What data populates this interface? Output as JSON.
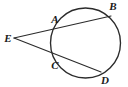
{
  "figure": {
    "type": "geometry-diagram",
    "background_color": "#ffffff",
    "stroke_color": "#2b2b2b",
    "label_color": "#1a1a1a",
    "circle": {
      "center_x": 85.5,
      "center_y": 43,
      "radius": 35
    },
    "points": [
      {
        "id": "E",
        "label": "E",
        "x": 14,
        "y": 38,
        "label_x": 8,
        "label_y": 42,
        "on_circle": false
      },
      {
        "id": "A",
        "label": "A",
        "x": 58,
        "y": 27,
        "label_x": 55,
        "label_y": 23,
        "on_circle": true
      },
      {
        "id": "B",
        "label": "B",
        "x": 111,
        "y": 16,
        "label_x": 113,
        "label_y": 10,
        "on_circle": true
      },
      {
        "id": "C",
        "label": "C",
        "x": 57,
        "y": 56,
        "label_x": 55,
        "label_y": 69,
        "on_circle": true
      },
      {
        "id": "D",
        "label": "D",
        "x": 101,
        "y": 72,
        "label_x": 105,
        "label_y": 84,
        "on_circle": true
      }
    ],
    "segments": [
      {
        "id": "EB",
        "from": "E",
        "to": "B",
        "description": "secant through A and B"
      },
      {
        "id": "ED",
        "from": "E",
        "to": "D",
        "description": "secant through C and D"
      }
    ]
  }
}
